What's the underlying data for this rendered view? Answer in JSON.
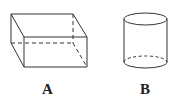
{
  "figures": [
    {
      "id": "box",
      "label": "A",
      "shape": "rectangular prism"
    },
    {
      "id": "cylinder",
      "label": "B",
      "shape": "cylinder"
    }
  ],
  "colors": {
    "stroke": "#333333",
    "label": "#222222",
    "background": "#ffffff"
  }
}
